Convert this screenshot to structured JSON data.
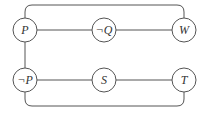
{
  "diagram": {
    "type": "graph",
    "stroke_color": "#555555",
    "nodes": [
      {
        "id": "P",
        "label": "P",
        "x": 25,
        "y": 30
      },
      {
        "id": "notQ",
        "label": "¬Q",
        "x": 104,
        "y": 30
      },
      {
        "id": "W",
        "label": "W",
        "x": 184,
        "y": 30
      },
      {
        "id": "notP",
        "label": "¬P",
        "x": 25,
        "y": 80
      },
      {
        "id": "S",
        "label": "S",
        "x": 104,
        "y": 80
      },
      {
        "id": "T",
        "label": "T",
        "x": 184,
        "y": 80
      }
    ],
    "edges": [
      {
        "from": "P",
        "to": "notQ",
        "shape": "straight"
      },
      {
        "from": "notQ",
        "to": "W",
        "shape": "straight"
      },
      {
        "from": "P",
        "to": "notP",
        "shape": "straight"
      },
      {
        "from": "notP",
        "to": "S",
        "shape": "straight"
      },
      {
        "from": "S",
        "to": "T",
        "shape": "straight"
      },
      {
        "from": "P",
        "to": "W",
        "shape": "rounded-loop-top"
      },
      {
        "from": "notP",
        "to": "T",
        "shape": "rounded-loop-bottom"
      }
    ]
  }
}
